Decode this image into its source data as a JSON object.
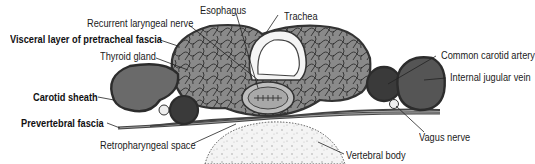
{
  "colors": {
    "tissue_fill": "#7a7a7a",
    "tissue_dark": "#4a4a4a",
    "fascia_outline": "#3a3a3a",
    "artery_fill": "#3c3c3c",
    "vein_fill": "#5c5c5c",
    "bone_fill": "#f2f2f2",
    "text": "#1a1a1a"
  },
  "labels": {
    "esophagus": "Esophagus",
    "trachea": "Trachea",
    "recurrent_laryngeal_nerve": "Recurrent laryngeal nerve",
    "visceral_layer": "Visceral layer of pretracheal fascia",
    "thyroid_gland": "Thyroid gland",
    "common_carotid_artery": "Common carotid artery",
    "internal_jugular_vein": "Internal jugular vein",
    "carotid_sheath": "Carotid sheath",
    "prevertebral_fascia": "Prevertebral fascia",
    "vagus_nerve": "Vagus nerve",
    "retropharyngeal_space": "Retropharyngeal space",
    "vertebral_body": "Vertebral body"
  }
}
